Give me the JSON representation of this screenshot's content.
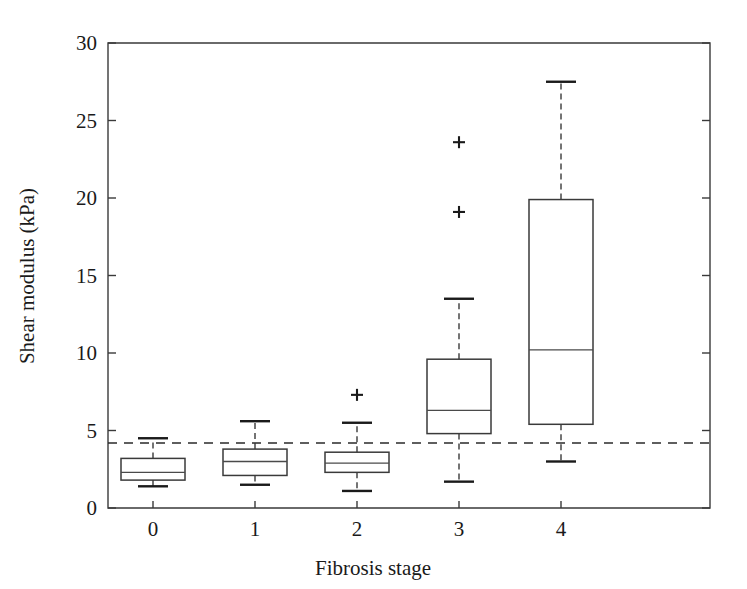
{
  "chart_data": {
    "type": "box",
    "title": "",
    "xlabel": "Fibrosis stage",
    "ylabel": "Shear modulus (kPa)",
    "categories": [
      "0",
      "1",
      "2",
      "3",
      "4"
    ],
    "xtick_labels": [
      "0",
      "1",
      "2",
      "3",
      "4"
    ],
    "ytick_labels": [
      "0",
      "5",
      "10",
      "15",
      "20",
      "25",
      "30"
    ],
    "ytick_values": [
      0,
      5,
      10,
      15,
      20,
      25,
      30
    ],
    "ylim": [
      0,
      30
    ],
    "grid": false,
    "legend": null,
    "reference_line": {
      "name": "cutoff-threshold",
      "value": 4.2,
      "style": "dashed",
      "orientation": "horizontal"
    },
    "boxes": [
      {
        "category": "0",
        "whisker_low": 1.4,
        "q1": 1.8,
        "median": 2.3,
        "q3": 3.2,
        "whisker_high": 4.5,
        "outliers": []
      },
      {
        "category": "1",
        "whisker_low": 1.5,
        "q1": 2.1,
        "median": 3.0,
        "q3": 3.8,
        "whisker_high": 5.6,
        "outliers": []
      },
      {
        "category": "2",
        "whisker_low": 1.1,
        "q1": 2.3,
        "median": 2.9,
        "q3": 3.6,
        "whisker_high": 5.5,
        "outliers": [
          7.3
        ]
      },
      {
        "category": "3",
        "whisker_low": 1.7,
        "q1": 4.8,
        "median": 6.3,
        "q3": 9.6,
        "whisker_high": 13.5,
        "outliers": [
          19.1,
          23.6
        ]
      },
      {
        "category": "4",
        "whisker_low": 3.0,
        "q1": 5.4,
        "median": 10.2,
        "q3": 19.9,
        "whisker_high": 27.5,
        "outliers": []
      }
    ]
  },
  "axes": {
    "y_title": "Shear modulus (kPa)",
    "x_title": "Fibrosis stage"
  }
}
